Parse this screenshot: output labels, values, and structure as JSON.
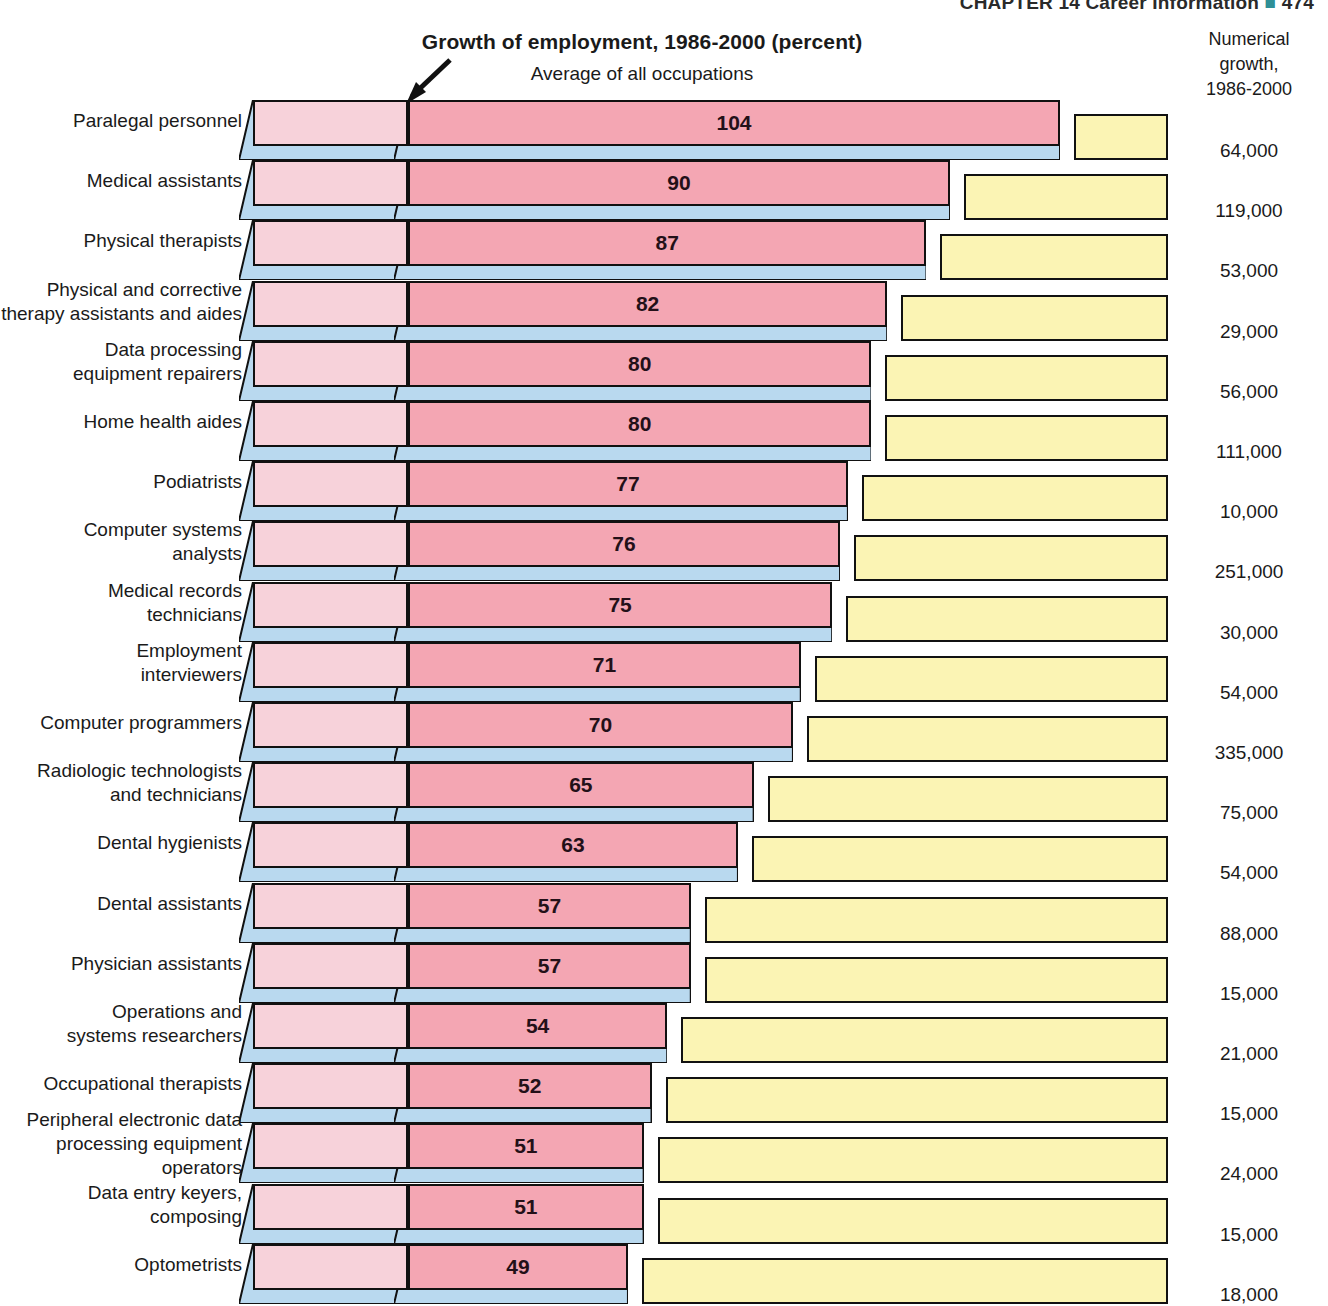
{
  "running_head": {
    "text": "CHAPTER 14  Career Information",
    "marker": "■",
    "page": "474"
  },
  "header": {
    "title": "Growth of employment, 1986-2000 (percent)",
    "subtitle": "Average of all occupations",
    "right_column_title": "Numerical\ngrowth,\n1986-2000",
    "right_column_line1": "Numerical",
    "right_column_line2": "growth,",
    "right_column_line3": "1986-2000"
  },
  "annotation": {
    "average_marker_label": "Average of all occupations",
    "arrow": "arrow pointing to average-of-all-occupations marker"
  },
  "colors": {
    "segment_base": "#f7d2da",
    "segment_main": "#f4a6b3",
    "segment_yellow": "#fbf4b4",
    "shadow_blue": "#b9d9ef",
    "outline": "#111111",
    "text": "#1a1a1a",
    "running_head_marker": "#2f8f96"
  },
  "chart_data": {
    "type": "bar",
    "title": "Growth of employment, 1986-2000 (percent)",
    "subtitle": "Average of all occupations",
    "xlabel": "Growth of employment, 1986-2000 (percent)",
    "ylabel": "",
    "xlim": [
      0,
      104
    ],
    "grid": false,
    "legend": "none",
    "orientation": "horizontal",
    "value_unit": "percent",
    "secondary_column": {
      "name": "Numerical growth, 1986-2000",
      "unit": "jobs"
    },
    "average_marker_percent": 21,
    "categories": [
      "Paralegal personnel",
      "Medical assistants",
      "Physical therapists",
      "Physical and corrective therapy assistants and aides",
      "Data processing equipment repairers",
      "Home health aides",
      "Podiatrists",
      "Computer systems analysts",
      "Medical records technicians",
      "Employment interviewers",
      "Computer programmers",
      "Radiologic technologists and technicians",
      "Dental hygienists",
      "Dental assistants",
      "Physician assistants",
      "Operations and systems researchers",
      "Occupational therapists",
      "Peripheral electronic data processing equipment operators",
      "Data entry keyers, composing",
      "Optometrists"
    ],
    "values": [
      104,
      90,
      87,
      82,
      80,
      80,
      77,
      76,
      75,
      71,
      70,
      65,
      63,
      57,
      57,
      54,
      52,
      51,
      51,
      49
    ],
    "numerical_growth": [
      "64,000",
      "119,000",
      "53,000",
      "29,000",
      "56,000",
      "111,000",
      "10,000",
      "251,000",
      "30,000",
      "54,000",
      "335,000",
      "75,000",
      "54,000",
      "88,000",
      "15,000",
      "21,000",
      "15,000",
      "24,000",
      "15,000",
      "18,000"
    ]
  },
  "rows": [
    {
      "label_lines": [
        "Paralegal personnel"
      ],
      "value": "104",
      "growth": "64,000"
    },
    {
      "label_lines": [
        "Medical assistants"
      ],
      "value": "90",
      "growth": "119,000"
    },
    {
      "label_lines": [
        "Physical therapists"
      ],
      "value": "87",
      "growth": "53,000"
    },
    {
      "label_lines": [
        "Physical and corrective",
        "therapy assistants and aides"
      ],
      "value": "82",
      "growth": "29,000"
    },
    {
      "label_lines": [
        "Data processing",
        "equipment repairers"
      ],
      "value": "80",
      "growth": "56,000"
    },
    {
      "label_lines": [
        "Home health aides"
      ],
      "value": "80",
      "growth": "111,000"
    },
    {
      "label_lines": [
        "Podiatrists"
      ],
      "value": "77",
      "growth": "10,000"
    },
    {
      "label_lines": [
        "Computer systems",
        "analysts"
      ],
      "value": "76",
      "growth": "251,000"
    },
    {
      "label_lines": [
        "Medical records",
        "technicians"
      ],
      "value": "75",
      "growth": "30,000"
    },
    {
      "label_lines": [
        "Employment",
        "interviewers"
      ],
      "value": "71",
      "growth": "54,000"
    },
    {
      "label_lines": [
        "Computer programmers"
      ],
      "value": "70",
      "growth": "335,000"
    },
    {
      "label_lines": [
        "Radiologic technologists",
        "and technicians"
      ],
      "value": "65",
      "growth": "75,000"
    },
    {
      "label_lines": [
        "Dental hygienists"
      ],
      "value": "63",
      "growth": "54,000"
    },
    {
      "label_lines": [
        "Dental assistants"
      ],
      "value": "57",
      "growth": "88,000"
    },
    {
      "label_lines": [
        "Physician assistants"
      ],
      "value": "57",
      "growth": "15,000"
    },
    {
      "label_lines": [
        "Operations and",
        "systems researchers"
      ],
      "value": "54",
      "growth": "21,000"
    },
    {
      "label_lines": [
        "Occupational therapists"
      ],
      "value": "52",
      "growth": "15,000"
    },
    {
      "label_lines": [
        "Peripheral electronic data",
        "processing equipment",
        "operators"
      ],
      "value": "51",
      "growth": "24,000"
    },
    {
      "label_lines": [
        "Data entry keyers,",
        "composing"
      ],
      "value": "51",
      "growth": "15,000"
    },
    {
      "label_lines": [
        "Optometrists"
      ],
      "value": "49",
      "growth": "18,000"
    }
  ]
}
